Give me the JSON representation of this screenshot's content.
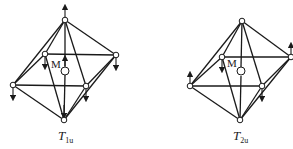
{
  "diagrams": [
    {
      "id": "T1u",
      "label_main": "T",
      "label_sub": "1u",
      "center_label": "M",
      "description": "Octahedral T1u vibrational mode: metal M at center with ligand displacement arrows"
    },
    {
      "id": "T2u",
      "label_main": "T",
      "label_sub": "2u",
      "center_label": "M",
      "description": "Octahedral T2u vibrational mode: metal M at center with ligand displacement arrows"
    }
  ]
}
